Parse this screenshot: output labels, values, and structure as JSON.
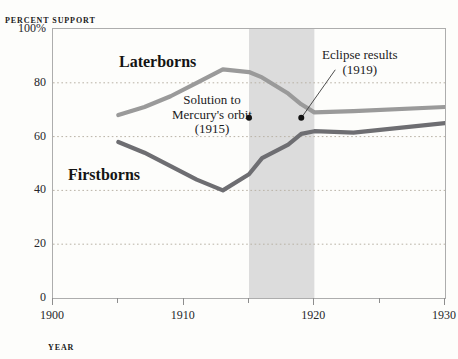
{
  "chart_data": {
    "type": "line",
    "title": "",
    "xlabel": "YEAR",
    "ylabel": "PERCENT SUPPORT",
    "xlim": [
      1900,
      1930
    ],
    "ylim": [
      0,
      100
    ],
    "grid": "horizontal-dotted",
    "legend_position": "inline-labels",
    "y_ticks": [
      {
        "value": 100,
        "label": "100%"
      },
      {
        "value": 80,
        "label": "80"
      },
      {
        "value": 60,
        "label": "60"
      },
      {
        "value": 40,
        "label": "40"
      },
      {
        "value": 20,
        "label": "20"
      },
      {
        "value": 0,
        "label": "0"
      }
    ],
    "x_ticks": [
      {
        "value": 1900,
        "label": "1900",
        "major": true
      },
      {
        "value": 1905,
        "label": "",
        "major": false
      },
      {
        "value": 1910,
        "label": "1910",
        "major": true
      },
      {
        "value": 1915,
        "label": "",
        "major": false
      },
      {
        "value": 1920,
        "label": "1920",
        "major": true
      },
      {
        "value": 1925,
        "label": "",
        "major": false
      },
      {
        "value": 1930,
        "label": "1930",
        "major": true
      }
    ],
    "series": [
      {
        "name": "Laterborns",
        "color": "#9a9a9a",
        "x": [
          1905,
          1907,
          1909,
          1911,
          1913,
          1915,
          1916,
          1918,
          1919,
          1920,
          1923,
          1930
        ],
        "values": [
          68,
          71,
          75,
          80,
          85,
          84,
          82,
          76,
          72,
          69,
          69.5,
          71
        ]
      },
      {
        "name": "Firstborns",
        "color": "#6e6e72",
        "x": [
          1905,
          1907,
          1909,
          1911,
          1913,
          1915,
          1916,
          1918,
          1919,
          1920,
          1923,
          1930
        ],
        "values": [
          58,
          54,
          49,
          44,
          40,
          46,
          52,
          57,
          61,
          62,
          61.5,
          65
        ]
      }
    ],
    "shaded_regions": [
      {
        "from": 1915,
        "to": 1920,
        "color": "#dcdcdc",
        "label": ""
      }
    ],
    "annotations": [
      {
        "id": "mercury",
        "lines": [
          "Solution to",
          "Mercury's orbit",
          "(1915)"
        ],
        "point_x": 1915,
        "point_y": 67
      },
      {
        "id": "eclipse",
        "lines": [
          "Eclipse results",
          "(1919)"
        ],
        "point_x": 1919,
        "point_y": 67
      }
    ],
    "series_labels": [
      {
        "name": "Laterborns"
      },
      {
        "name": "Firstborns"
      }
    ]
  }
}
